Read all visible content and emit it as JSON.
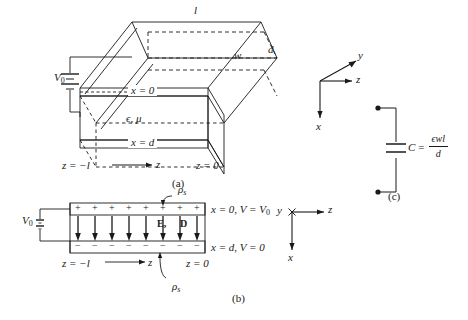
{
  "figure": {
    "panels": [
      {
        "id": "a",
        "tag": "(a)"
      },
      {
        "id": "b",
        "tag": "(b)"
      },
      {
        "id": "c",
        "tag": "(c)"
      }
    ]
  },
  "panel_a": {
    "tag": "(a)",
    "source_label": "V",
    "source_sub": "0",
    "length_label": "l",
    "width_label": "w",
    "depth_label": "d",
    "top_plane_label": "x = 0",
    "bottom_plane_label": "x = d",
    "material_label": "ϵ, μ",
    "z_left_label": "z = −l",
    "z_axis_label": "z",
    "z_right_label": "z = 0"
  },
  "axes_a": {
    "y_label": "y",
    "z_label": "z",
    "x_label": "x"
  },
  "panel_b": {
    "tag": "(b)",
    "source_label": "V",
    "source_sub": "0",
    "top_charge_label": "ρ",
    "top_charge_sub": "s",
    "bottom_charge_label": "ρ",
    "bottom_charge_sub": "s",
    "plus_sign": "+",
    "minus_sign": "−",
    "plus_count": 8,
    "minus_count": 8,
    "arrow_count": 8,
    "field_label_e": "E,",
    "field_label_d": "D",
    "top_boundary_label": "x = 0, V = V",
    "top_boundary_sub": "0",
    "bottom_boundary_label": "x = d, V = 0",
    "z_left_label": "z = −l",
    "z_axis_label": "z",
    "z_right_label": "z = 0"
  },
  "axes_b": {
    "y_label": "y",
    "z_label": "z",
    "x_label": "x"
  },
  "panel_c": {
    "tag": "(c)",
    "cap_name": "C",
    "equals": "=",
    "numerator": "ϵwl",
    "denominator": "d"
  },
  "colors": {
    "stroke": "#1a1a1a",
    "dashed": "#2a2a2a",
    "background": "#ffffff"
  }
}
